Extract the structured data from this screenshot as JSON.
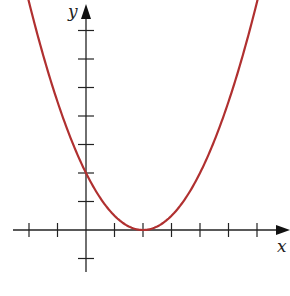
{
  "chart_data": {
    "type": "line",
    "title": "",
    "xlabel": "x",
    "ylabel": "y",
    "function": "y = (x - 2)^2 / 2",
    "vertex": [
      2,
      0
    ],
    "y_intercept": [
      0,
      2
    ],
    "xlim": [
      -2.5,
      7.1
    ],
    "ylim": [
      -1.5,
      8
    ],
    "grid": false,
    "legend": null,
    "x_ticks": [
      -2,
      -1,
      1,
      2,
      3,
      4,
      5,
      6
    ],
    "y_ticks": [
      -1,
      1,
      2,
      3,
      4,
      5,
      6,
      7
    ],
    "tick_labels_shown": false,
    "series": [
      {
        "name": "parabola",
        "color": "#b03030",
        "x": [
          -2,
          -1,
          0,
          1,
          2,
          3,
          4,
          5,
          6
        ],
        "y": [
          8,
          4.5,
          2,
          0.5,
          0,
          0.5,
          2,
          4.5,
          8
        ]
      }
    ]
  },
  "colors": {
    "curve": "#b03030",
    "axes": "#222222",
    "background": "#ffffff"
  }
}
